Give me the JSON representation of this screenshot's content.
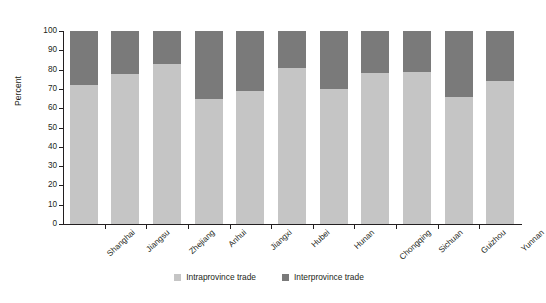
{
  "chart_data": {
    "type": "bar",
    "title": "",
    "subtitle": "",
    "xlabel": "",
    "ylabel": "Percent",
    "ylim": [
      0,
      100
    ],
    "ytick_step": 10,
    "yticks": [
      0,
      10,
      20,
      30,
      40,
      50,
      60,
      70,
      80,
      90,
      100
    ],
    "grid": false,
    "stacked": true,
    "stacked_total": 100,
    "legend_position": "bottom-center",
    "categories": [
      "Shanghai",
      "Jiangsu",
      "Zhejiang",
      "Anhui",
      "Jiangxi",
      "Hubei",
      "Hunan",
      "Chongqing",
      "Sichuan",
      "Guizhou",
      "Yunnan"
    ],
    "series": [
      {
        "name": "Intraprovince trade",
        "color": "#c5c5c5",
        "values": [
          72,
          77.5,
          83,
          65,
          69,
          81,
          70,
          78,
          79,
          66,
          74
        ]
      },
      {
        "name": "Interprovince trade",
        "color": "#7a7a7a",
        "values": [
          28,
          22.5,
          17,
          35,
          31,
          19,
          30,
          22,
          21,
          34,
          26
        ]
      }
    ]
  },
  "legend": {
    "items": [
      {
        "label": "Intraprovince trade",
        "color": "#c5c5c5"
      },
      {
        "label": "Interprovince trade",
        "color": "#7a7a7a"
      }
    ]
  },
  "axis": {
    "y_title": "Percent"
  }
}
